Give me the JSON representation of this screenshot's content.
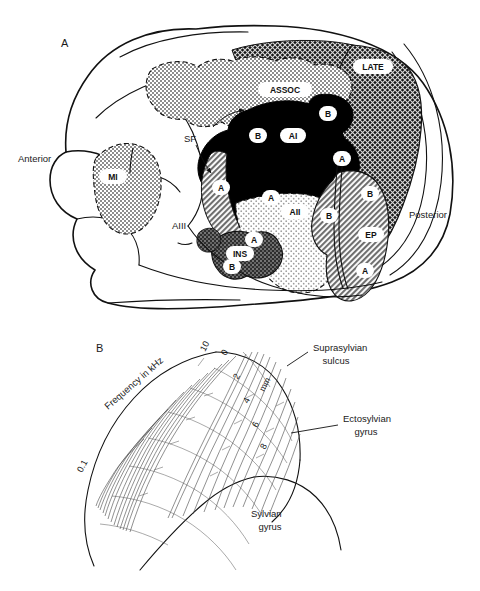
{
  "figure": {
    "panels": [
      {
        "id": "A",
        "letter": "A"
      },
      {
        "id": "B",
        "letter": "B"
      }
    ]
  },
  "panel_a": {
    "letter": "A",
    "orientation": {
      "anterior": "Anterior",
      "posterior": "Posterior"
    },
    "fields": [
      {
        "name": "MI",
        "label": "MI",
        "fill": "stipple-mid",
        "border": "dashed"
      },
      {
        "name": "ASSOC",
        "label": "ASSOC",
        "fill": "stipple-mid",
        "border": "dashed"
      },
      {
        "name": "LATE",
        "label": "LATE",
        "fill": "crosshatch-dark",
        "border": "solid"
      },
      {
        "name": "AI",
        "label": "AI",
        "fill": "solid-black",
        "border": "solid"
      },
      {
        "name": "AII",
        "label": "AII",
        "fill": "stipple-light",
        "border": "dashed"
      },
      {
        "name": "EP",
        "label": "EP",
        "fill": "hatch-mid",
        "border": "solid"
      },
      {
        "name": "INS",
        "label": "INS",
        "fill": "speckle-dark",
        "border": "solid"
      },
      {
        "name": "AIII",
        "label": "AIII",
        "fill": "speckle-dark",
        "border": "solid"
      }
    ],
    "subfield_labels": {
      "ai_a": "A",
      "ai_b": "B",
      "ai_b_upper": "B",
      "ai_a_right": "A",
      "aii_a": "A",
      "aii_b": "B",
      "ep_a": "A",
      "ep_b": "B",
      "ins_a": "A",
      "ins_b": "B"
    },
    "sulcus_marker": "SF"
  },
  "panel_b": {
    "letter": "B",
    "axis_frequency": {
      "title": "Frequency in kHz",
      "ticks": [
        "10",
        "0.1"
      ]
    },
    "axis_distance": {
      "title": "mm",
      "ticks": [
        "0",
        "2",
        "4",
        "6",
        "8"
      ]
    },
    "anatomy_labels": [
      {
        "name": "suprasylvian-sulcus",
        "line1": "Suprasylvian",
        "line2": "sulcus"
      },
      {
        "name": "ectosylvian-gyrus",
        "line1": "Ectosylvian",
        "line2": "gyrus"
      },
      {
        "name": "sylvian-gyrus",
        "line1": "Sylvian",
        "line2": "gyrus"
      }
    ]
  },
  "colors": {
    "ink": "#111111",
    "black_field": "#000000",
    "mid_gray": "#9a9a9a",
    "light_gray": "#d8d8d8",
    "dark_gray": "#4a4a4a",
    "paper": "#ffffff"
  }
}
